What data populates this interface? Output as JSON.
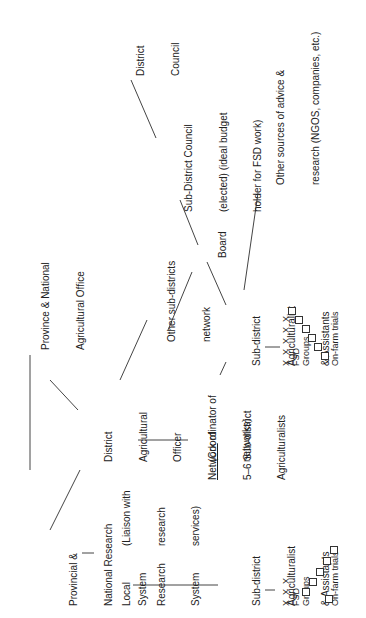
{
  "diagram": {
    "orientation": "rotated-90-ccw",
    "nodes": {
      "district_council": {
        "lines": [
          "District",
          "Council"
        ]
      },
      "sub_district_council": {
        "lines": [
          "Sub-District Council",
          "(elected) (ideal budget",
          "holder for FSD work)"
        ]
      },
      "other_sources": {
        "lines": [
          "Other sources of advice &",
          "research (NGOS, companies, etc.)"
        ]
      },
      "province_national_ag_office": {
        "lines": [
          "Province & National",
          "Agricultural Office"
        ]
      },
      "other_subdistricts_network": {
        "lines": [
          "Other sub-districts",
          "network"
        ]
      },
      "board": {
        "lines": [
          "Board"
        ]
      },
      "district_ag_officer": {
        "lines": [
          "District",
          "Agricultural",
          "Officer",
          "(Coordinator of",
          "networks)"
        ]
      },
      "network_of_subdistrict_ags": {
        "underlined": "Network",
        "lines": [
          " of",
          "5–6 Sub-district",
          "Agriculturalists"
        ]
      },
      "sub_district_ag_right": {
        "lines": [
          "Sub-district",
          "Agriculturalist",
          "& Assistants"
        ]
      },
      "provincial_national_research": {
        "lines": [
          "Provincial &",
          "National Research",
          "System"
        ]
      },
      "local_research_system": {
        "lines": [
          "Local",
          "Research",
          "System"
        ]
      },
      "liaison_note": {
        "lines": [
          "(Liaison with",
          "research",
          "services)"
        ]
      },
      "sub_district_ag_bottom": {
        "lines": [
          "Sub-district",
          "Agriculturalist",
          "& Assistants"
        ]
      }
    },
    "clusters": {
      "right": {
        "x_marks": "X  X  X  X  X",
        "fsd_label": "FSD",
        "groups_label": "Groups",
        "trials_label": "On-farm trials"
      },
      "bottom": {
        "x_marks": "X  X  X",
        "fsd_label": "FSD",
        "groups_label": "Groups",
        "trials_label": "On-farm trials"
      }
    },
    "line_color": "#444444",
    "text_color": "#222222"
  }
}
